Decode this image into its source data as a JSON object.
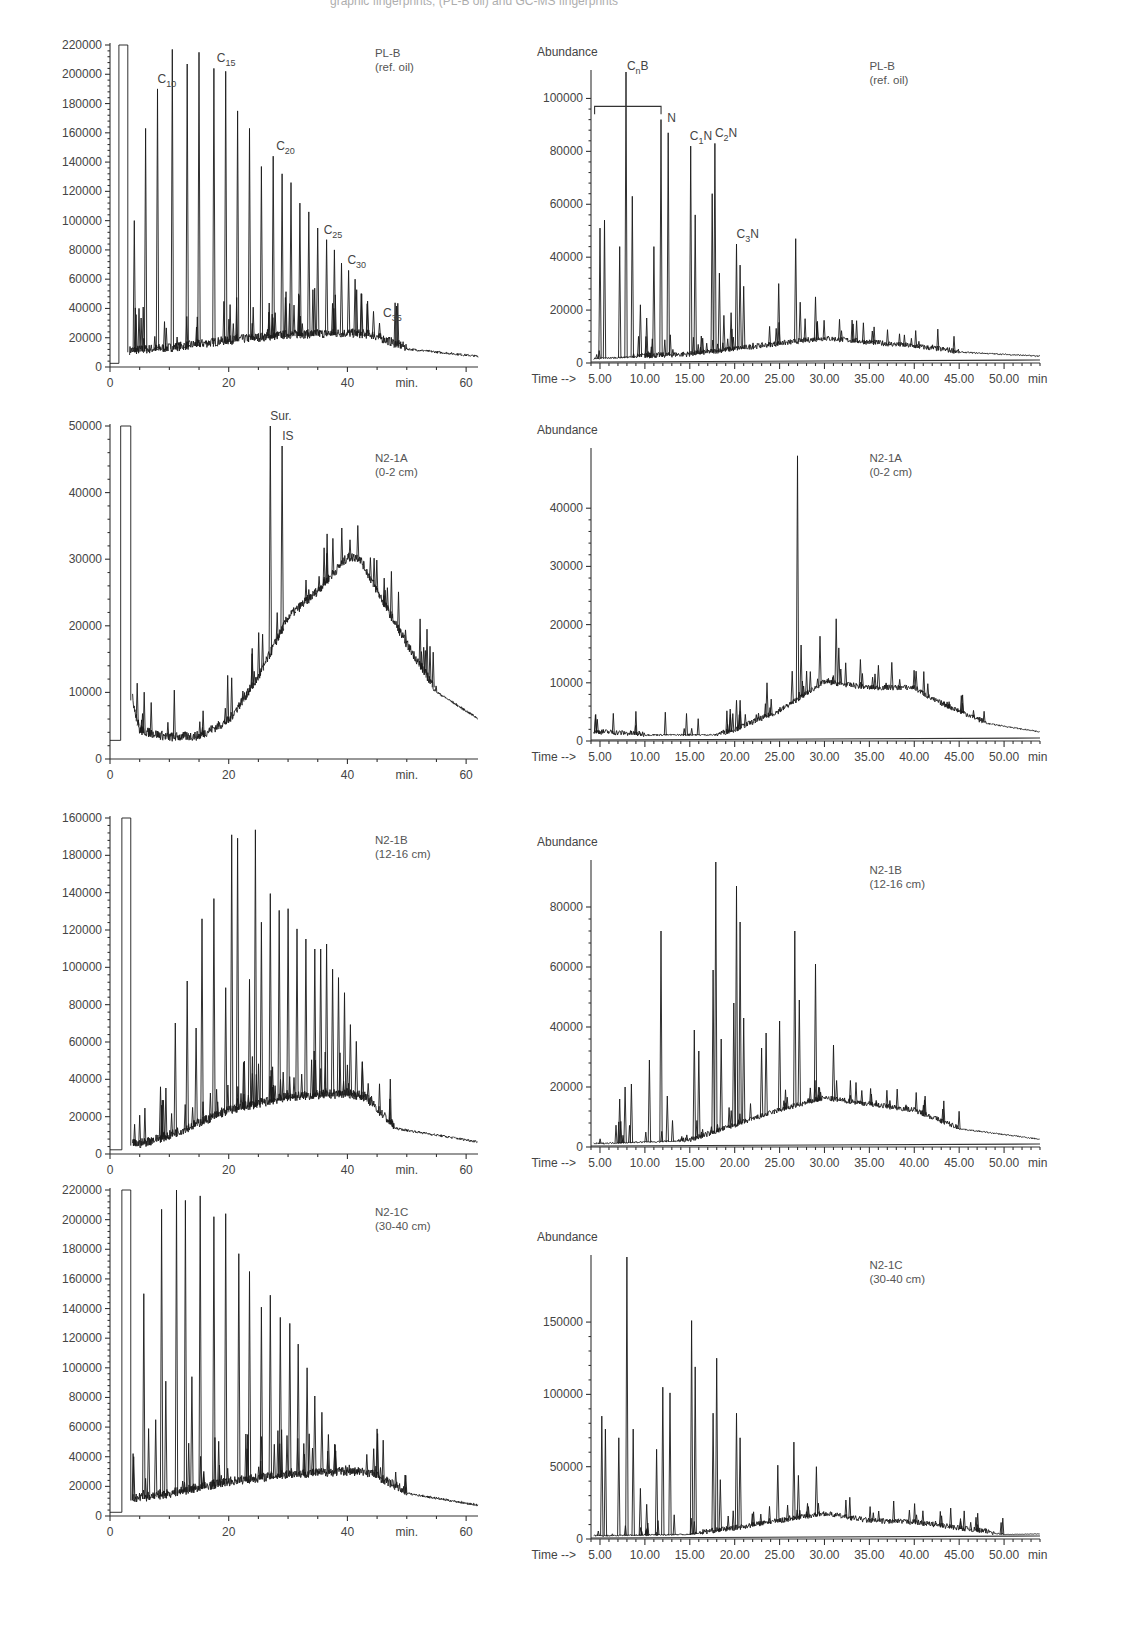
{
  "figure": {
    "top_caption_fragment": "graphic fingerprints; (PL-B oil) and GC-MS fingerprints"
  },
  "panels": [
    {
      "id": "plb-fid",
      "sample": "PL-B",
      "sample_sub": "(ref. oil)",
      "y_ticks": [
        "0",
        "20000",
        "40000",
        "60000",
        "80000",
        "100000",
        "120000",
        "140000",
        "160000",
        "180000",
        "200000",
        "220000"
      ],
      "x_ticks": [
        "0",
        "20",
        "40",
        "60"
      ],
      "x_unit": "min.",
      "annotations": [
        "C10",
        "C15",
        "C20",
        "C25",
        "C30",
        "C35"
      ]
    },
    {
      "id": "plb-ms",
      "sample": "PL-B",
      "sample_sub": "(ref. oil)",
      "y_label": "Abundance",
      "y_ticks": [
        "0",
        "20000",
        "40000",
        "60000",
        "80000",
        "100000"
      ],
      "x_prefix": "Time -->",
      "x_ticks": [
        "5.00",
        "10.00",
        "15.00",
        "20.00",
        "25.00",
        "30.00",
        "35.00",
        "40.00",
        "45.00",
        "50.00"
      ],
      "x_unit": "min",
      "annotations": [
        "CnB",
        "N",
        "C1N",
        "C2N",
        "C3N"
      ]
    },
    {
      "id": "n21a-fid",
      "sample": "N2-1A",
      "sample_sub": "(0-2 cm)",
      "y_ticks": [
        "0",
        "10000",
        "20000",
        "30000",
        "40000",
        "50000"
      ],
      "x_ticks": [
        "0",
        "20",
        "40",
        "60"
      ],
      "x_unit": "min.",
      "annotations": [
        "Sur.",
        "IS"
      ]
    },
    {
      "id": "n21a-ms",
      "sample": "N2-1A",
      "sample_sub": "(0-2 cm)",
      "y_label": "Abundance",
      "y_ticks": [
        "0",
        "10000",
        "20000",
        "30000",
        "40000"
      ],
      "x_prefix": "Time -->",
      "x_ticks": [
        "5.00",
        "10.00",
        "15.00",
        "20.00",
        "25.00",
        "30.00",
        "35.00",
        "40.00",
        "45.00",
        "50.00"
      ],
      "x_unit": "min"
    },
    {
      "id": "n21b-fid",
      "sample": "N2-1B",
      "sample_sub": "(12-16 cm)",
      "y_ticks": [
        "0",
        "20000",
        "40000",
        "60000",
        "80000",
        "100000",
        "120000",
        "140000",
        "180000",
        "160000"
      ],
      "x_ticks": [
        "0",
        "20",
        "40",
        "60"
      ],
      "x_unit": "min."
    },
    {
      "id": "n21b-ms",
      "sample": "N2-1B",
      "sample_sub": "(12-16 cm)",
      "y_label": "Abundance",
      "y_ticks": [
        "0",
        "20000",
        "40000",
        "60000",
        "80000"
      ],
      "x_prefix": "Time -->",
      "x_ticks": [
        "5.00",
        "10.00",
        "15.00",
        "20.00",
        "25.00",
        "30.00",
        "35.00",
        "40.00",
        "45.00",
        "50.00"
      ],
      "x_unit": "min"
    },
    {
      "id": "n21c-fid",
      "sample": "N2-1C",
      "sample_sub": "(30-40 cm)",
      "y_ticks": [
        "0",
        "20000",
        "40000",
        "60000",
        "80000",
        "100000",
        "120000",
        "140000",
        "160000",
        "180000",
        "200000",
        "220000"
      ],
      "x_ticks": [
        "0",
        "20",
        "40",
        "60"
      ],
      "x_unit": "min."
    },
    {
      "id": "n21c-ms",
      "sample": "N2-1C",
      "sample_sub": "(30-40 cm)",
      "y_label": "Abundance",
      "y_ticks": [
        "0",
        "50000",
        "100000",
        "150000"
      ],
      "x_prefix": "Time -->",
      "x_ticks": [
        "5.00",
        "10.00",
        "15.00",
        "20.00",
        "25.00",
        "30.00",
        "35.00",
        "40.00",
        "45.00",
        "50.00"
      ],
      "x_unit": "min"
    }
  ],
  "chart_data": [
    {
      "type": "line",
      "title": "PL-B (ref. oil) GC-FID",
      "xlabel": "min.",
      "ylabel": "",
      "xlim": [
        0,
        62
      ],
      "ylim": [
        0,
        220000
      ],
      "annotations": [
        {
          "text": "C10",
          "x": 8
        },
        {
          "text": "C15",
          "x": 18
        },
        {
          "text": "C20",
          "x": 28
        },
        {
          "text": "C25",
          "x": 36
        },
        {
          "text": "C30",
          "x": 40
        },
        {
          "text": "C35",
          "x": 46
        }
      ],
      "series": [
        {
          "name": "n-alkane peaks",
          "x": [
            4.1,
            6.0,
            8.0,
            10.5,
            13,
            15,
            17.5,
            19.5,
            21.5,
            23.5,
            25.5,
            27.5,
            29,
            30.5,
            32,
            33.5,
            35,
            36.5,
            37.8,
            39,
            40.2,
            41.3,
            42.4,
            43.4,
            44.4,
            45.4
          ],
          "values": [
            100000,
            163000,
            190000,
            217000,
            207000,
            215000,
            204000,
            202000,
            175000,
            163000,
            137000,
            144000,
            132000,
            126000,
            112000,
            106000,
            95000,
            87000,
            80000,
            71000,
            66000,
            60000,
            50000,
            45000,
            38000,
            30000
          ]
        }
      ],
      "baseline_hump": {
        "x": [
          3,
          10,
          20,
          30,
          40,
          44,
          50,
          62
        ],
        "values": [
          10000,
          12000,
          17000,
          21000,
          22000,
          21000,
          12000,
          7000
        ]
      },
      "solvent_peak": {
        "x": [
          1.5,
          3.0
        ],
        "value": 220000
      }
    },
    {
      "type": "line",
      "title": "PL-B (ref. oil) GC-MS",
      "xlabel": "Time (min)",
      "ylabel": "Abundance",
      "xlim": [
        4,
        54
      ],
      "ylim": [
        0,
        110000
      ],
      "annotations": [
        {
          "text": "CnB",
          "x": 8
        },
        {
          "text": "N",
          "x": 12.5
        },
        {
          "text": "C1N",
          "x": 15
        },
        {
          "text": "C2N",
          "x": 17.8
        },
        {
          "text": "C3N",
          "x": 20.2
        }
      ],
      "series": [
        {
          "name": "peaks",
          "x": [
            5.0,
            5.5,
            7.2,
            7.9,
            8.6,
            9.5,
            10.2,
            11.0,
            11.8,
            12.6,
            15.1,
            15.6,
            17.5,
            17.8,
            18.3,
            18.8,
            19.6,
            20.2,
            20.6,
            21.0,
            24.9,
            26.8,
            27.3,
            29.0,
            40.2
          ],
          "values": [
            51000,
            54000,
            44000,
            110000,
            63000,
            22000,
            17000,
            44000,
            92000,
            87000,
            82000,
            56000,
            64000,
            83000,
            34000,
            18000,
            19000,
            45000,
            37000,
            29000,
            30000,
            47000,
            23000,
            25000,
            6000
          ]
        }
      ],
      "baseline_hump": {
        "x": [
          4,
          15,
          20,
          25,
          30,
          40,
          45,
          54
        ],
        "values": [
          1500,
          3000,
          5000,
          7000,
          9000,
          6000,
          4000,
          2500
        ]
      }
    },
    {
      "type": "line",
      "title": "N2-1A (0-2 cm) GC-FID",
      "xlabel": "min.",
      "ylabel": "",
      "xlim": [
        0,
        62
      ],
      "ylim": [
        0,
        50000
      ],
      "annotations": [
        {
          "text": "Sur.",
          "x": 27
        },
        {
          "text": "IS",
          "x": 29
        }
      ],
      "series": [
        {
          "name": "peaks",
          "x": [
            27,
            29
          ],
          "values": [
            50000,
            47000
          ]
        }
      ],
      "baseline_hump": {
        "x": [
          3,
          5,
          10,
          15,
          20,
          25,
          30,
          35,
          40,
          42,
          45,
          50,
          55,
          62
        ],
        "values": [
          12000,
          4000,
          3000,
          3200,
          5500,
          12000,
          21000,
          25000,
          30000,
          30000,
          25000,
          17000,
          10000,
          6000
        ]
      },
      "solvent_peak": {
        "x": [
          1.8,
          3.5
        ],
        "value": 50000
      }
    },
    {
      "type": "line",
      "title": "N2-1A (0-2 cm) GC-MS",
      "xlabel": "Time (min)",
      "ylabel": "Abundance",
      "xlim": [
        4,
        54
      ],
      "ylim": [
        0,
        50000
      ],
      "series": [
        {
          "name": "peaks",
          "x": [
            20.2,
            20.6,
            23.6,
            26.4,
            27.0,
            27.4,
            29.5,
            31.3,
            31.6,
            34.0,
            36.0,
            37.5,
            40.2
          ],
          "values": [
            7000,
            7000,
            10000,
            12000,
            49000,
            16500,
            18000,
            21000,
            16000,
            14000,
            13000,
            13500,
            12000
          ]
        }
      ],
      "baseline_hump": {
        "x": [
          4,
          10,
          18,
          20,
          25,
          30,
          35,
          40,
          42,
          48,
          54
        ],
        "values": [
          1500,
          1000,
          1000,
          1800,
          5000,
          10000,
          9000,
          9000,
          7000,
          3000,
          1500
        ]
      }
    },
    {
      "type": "line",
      "title": "N2-1B (12-16 cm) GC-FID",
      "xlabel": "min.",
      "ylabel": "",
      "xlim": [
        0,
        62
      ],
      "ylim": [
        0,
        200000
      ],
      "series": [
        {
          "name": "n-alkane peaks",
          "x": [
            8.5,
            9.0,
            11,
            13,
            14.5,
            15.5,
            17.5,
            19.5,
            20.5,
            21.5,
            23.5,
            24.5,
            25.5,
            27,
            28.5,
            30,
            31.5,
            33,
            34.5,
            35.5,
            36.5,
            37.5,
            38.5,
            39.5,
            40.5,
            41.5,
            42.5,
            43.5
          ],
          "values": [
            40000,
            32000,
            78000,
            103000,
            75000,
            140000,
            152000,
            99000,
            190000,
            188000,
            104000,
            193000,
            138000,
            155000,
            145000,
            146000,
            134000,
            128000,
            122000,
            122000,
            125000,
            110000,
            105000,
            96000,
            77000,
            67000,
            55000,
            42000
          ]
        }
      ],
      "baseline_hump": {
        "x": [
          5,
          10,
          20,
          30,
          40,
          43,
          48,
          62
        ],
        "values": [
          5000,
          10000,
          25000,
          33000,
          35000,
          33000,
          15000,
          7000
        ]
      },
      "solvent_peak": {
        "x": [
          2.0,
          3.5
        ],
        "value": 200000
      }
    },
    {
      "type": "line",
      "title": "N2-1B (12-16 cm) GC-MS",
      "xlabel": "Time (min)",
      "ylabel": "Abundance",
      "xlim": [
        4,
        54
      ],
      "ylim": [
        0,
        95000
      ],
      "series": [
        {
          "name": "peaks",
          "x": [
            7.2,
            7.8,
            8.5,
            10.5,
            11.8,
            12.5,
            15.5,
            16.0,
            17.6,
            17.9,
            18.5,
            19.9,
            20.2,
            20.6,
            21.0,
            23.0,
            23.5,
            25.0,
            26.7,
            27.2,
            29.0,
            31.0
          ],
          "values": [
            16000,
            20000,
            21000,
            29000,
            72000,
            17000,
            39000,
            32000,
            59000,
            95000,
            36000,
            48000,
            87000,
            75000,
            43000,
            33000,
            38000,
            42000,
            72000,
            49000,
            61000,
            34000
          ]
        }
      ],
      "baseline_hump": {
        "x": [
          4,
          15,
          20,
          25,
          30,
          35,
          40,
          45,
          54
        ],
        "values": [
          1000,
          2000,
          7000,
          12000,
          16000,
          14000,
          12000,
          6000,
          2500
        ]
      }
    },
    {
      "type": "line",
      "title": "N2-1C (30-40 cm) GC-FID",
      "xlabel": "min.",
      "ylabel": "",
      "xlim": [
        0,
        62
      ],
      "ylim": [
        0,
        220000
      ],
      "series": [
        {
          "name": "n-alkane peaks",
          "x": [
            4.0,
            5.7,
            6.5,
            7.7,
            8.7,
            9.4,
            11.2,
            12.7,
            13.8,
            15.2,
            17.5,
            19.5,
            21.7,
            23.5,
            25.5,
            27,
            28.7,
            30.3,
            31.7,
            33.2,
            34.5,
            35.7,
            36.8,
            37.9
          ],
          "values": [
            40000,
            150000,
            59000,
            65000,
            207000,
            91000,
            220000,
            213000,
            94000,
            216000,
            202000,
            204000,
            177000,
            165000,
            141000,
            149000,
            134000,
            130000,
            116000,
            100000,
            81000,
            70000,
            55000,
            48000
          ]
        }
      ],
      "baseline_hump": {
        "x": [
          3,
          10,
          20,
          30,
          40,
          44,
          50,
          62
        ],
        "values": [
          10000,
          14000,
          22000,
          27000,
          29000,
          28000,
          15000,
          7000
        ]
      },
      "solvent_peak": {
        "x": [
          2.0,
          3.5
        ],
        "value": 220000
      }
    },
    {
      "type": "line",
      "title": "N2-1C (30-40 cm) GC-MS",
      "xlabel": "Time (min)",
      "ylabel": "Abundance",
      "xlim": [
        4,
        54
      ],
      "ylim": [
        0,
        195000
      ],
      "series": [
        {
          "name": "peaks",
          "x": [
            5.2,
            5.6,
            7.1,
            8.0,
            8.7,
            9.5,
            10.2,
            11.3,
            12.0,
            12.8,
            15.2,
            15.6,
            17.6,
            18.0,
            18.4,
            20.2,
            20.6,
            24.8,
            26.6,
            27.1,
            29.1
          ],
          "values": [
            85000,
            76000,
            70000,
            195000,
            76000,
            35000,
            24000,
            62000,
            105000,
            101000,
            151000,
            119000,
            87000,
            125000,
            41000,
            87000,
            70000,
            51000,
            67000,
            44000,
            50000
          ]
        }
      ],
      "baseline_hump": {
        "x": [
          4,
          15,
          20,
          25,
          30,
          35,
          40,
          45,
          50,
          54
        ],
        "values": [
          2000,
          3000,
          7000,
          12000,
          17000,
          12000,
          11000,
          7000,
          3000,
          3500
        ]
      }
    }
  ]
}
